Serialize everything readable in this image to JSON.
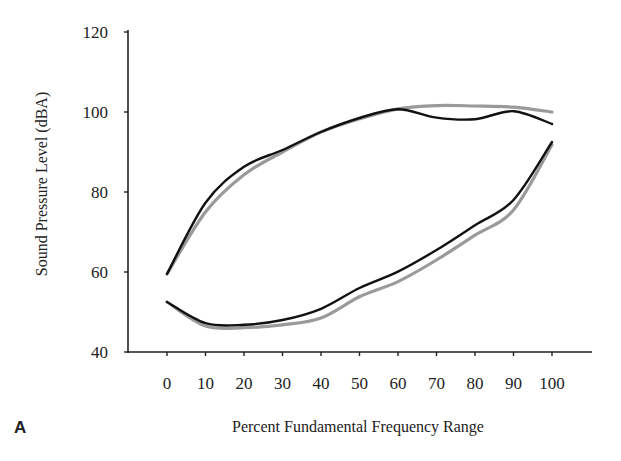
{
  "panel_label": "A",
  "chart_data": {
    "type": "line",
    "title": "",
    "xlabel": "Percent Fundamental Frequency Range",
    "ylabel": "Sound Pressure Level (dBA)",
    "x": [
      0,
      10,
      20,
      30,
      40,
      50,
      60,
      70,
      80,
      90,
      100
    ],
    "x_tick_labels": [
      "0",
      "10",
      "20",
      "30",
      "40",
      "50",
      "60",
      "70",
      "80",
      "90",
      "100"
    ],
    "y_ticks": [
      40,
      60,
      80,
      100,
      120
    ],
    "y_tick_labels": [
      "40",
      "60",
      "80",
      "100",
      "120"
    ],
    "xlim": [
      -3,
      108
    ],
    "ylim": [
      40,
      120
    ],
    "grid": false,
    "legend": null,
    "series": [
      {
        "name": "upper contour (black)",
        "color": "#111111",
        "width": 2.4,
        "values": [
          59.5,
          77.3,
          86.3,
          90.5,
          95.0,
          98.5,
          100.7,
          98.6,
          98.2,
          100.2,
          97.0
        ]
      },
      {
        "name": "upper contour (gray)",
        "color": "#9a9a9a",
        "width": 3.2,
        "values": [
          59.5,
          75.0,
          84.3,
          90.0,
          95.0,
          98.3,
          100.8,
          101.6,
          101.5,
          101.2,
          100.0
        ]
      },
      {
        "name": "lower contour (black)",
        "color": "#111111",
        "width": 2.4,
        "values": [
          52.5,
          47.2,
          46.8,
          48.0,
          50.8,
          56.0,
          60.1,
          65.5,
          71.7,
          78.0,
          92.5
        ]
      },
      {
        "name": "lower contour (gray)",
        "color": "#9a9a9a",
        "width": 3.2,
        "values": [
          52.5,
          46.5,
          46.1,
          46.8,
          48.5,
          53.8,
          57.6,
          63.0,
          69.2,
          75.5,
          91.8
        ]
      }
    ]
  }
}
